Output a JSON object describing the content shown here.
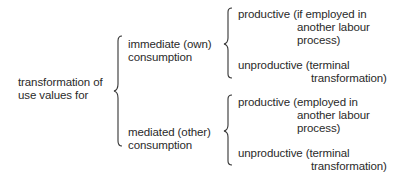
{
  "root": {
    "line1": "transformation of",
    "line2": "use values for"
  },
  "branches": [
    {
      "line1": "immediate (own)",
      "line2": "consumption",
      "children": [
        {
          "line1": "productive (if employed in",
          "line2": "another labour",
          "line3": "process)"
        },
        {
          "line1": "unproductive (terminal",
          "line2": "transformation)"
        }
      ]
    },
    {
      "line1": "mediated (other)",
      "line2": "consumption",
      "children": [
        {
          "line1": "productive (employed in",
          "line2": "another labour",
          "line3": "process)"
        },
        {
          "line1": "unproductive (terminal",
          "line2": "transformation)"
        }
      ]
    }
  ]
}
